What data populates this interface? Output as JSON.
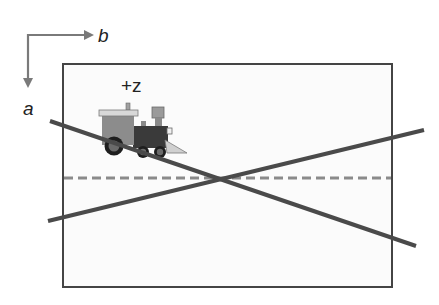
{
  "diagram": {
    "axes": {
      "horizontal_label": "b",
      "vertical_label": "a",
      "arrow_color": "#7a7a7a"
    },
    "frame": {
      "border_color": "#444444",
      "fill_color": "#fbfbfb"
    },
    "train": {
      "label": "+z",
      "colors": {
        "cab_body": "#8c8c8c",
        "cab_roof": "#d8d8d8",
        "boiler": "#3a3a3a",
        "smokestack": "#9a9a9a",
        "wheel": "#1e1e1e",
        "wheel_hub": "#6a6a6a",
        "cowcatcher": "#d0d0d0"
      }
    },
    "lines": {
      "color": "#4a4a4a",
      "dashed_color": "#8a8a8a",
      "descending": {
        "from": [
          50,
          121
        ],
        "to": [
          416,
          246
        ]
      },
      "ascending": {
        "from": [
          48,
          221
        ],
        "to": [
          424,
          130
        ]
      },
      "dashed_centerline_y": 178
    }
  }
}
